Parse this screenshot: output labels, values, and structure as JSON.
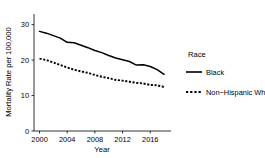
{
  "chart_data": {
    "type": "line",
    "title": "",
    "xlabel": "Year",
    "ylabel": "Mortality Rate per 100,000",
    "xlim": [
      1999.2,
      2019.0
    ],
    "ylim": [
      0,
      33
    ],
    "grid": false,
    "legend_position": "right",
    "legend_title": "Race",
    "xticks": [
      2000,
      2004,
      2008,
      2012,
      2016
    ],
    "xtick_labels": [
      "2000",
      "2004",
      "2008",
      "2012",
      "2016"
    ],
    "yticks": [
      0,
      10,
      20,
      30
    ],
    "ytick_labels": [
      "0",
      "10",
      "20",
      "30"
    ],
    "x": [
      2000,
      2001,
      2002,
      2003,
      2004,
      2005,
      2006,
      2007,
      2008,
      2009,
      2010,
      2011,
      2012,
      2013,
      2014,
      2015,
      2016,
      2017,
      2018
    ],
    "series": [
      {
        "name": "Black",
        "style": "solid",
        "color": "#000000",
        "values": [
          28.1,
          27.6,
          26.9,
          26.2,
          25.0,
          24.9,
          24.2,
          23.5,
          22.7,
          22.1,
          21.3,
          20.6,
          20.1,
          19.6,
          18.6,
          18.7,
          18.2,
          17.3,
          16.0
        ]
      },
      {
        "name": "Non−Hispanic White",
        "style": "dashed",
        "color": "#000000",
        "values": [
          20.4,
          20.0,
          19.3,
          18.6,
          17.9,
          17.3,
          16.8,
          16.4,
          15.8,
          15.3,
          14.9,
          14.4,
          14.2,
          13.9,
          13.6,
          13.4,
          13.0,
          12.9,
          12.4
        ]
      }
    ]
  },
  "legend": {
    "title": "Race",
    "entries": [
      {
        "label": "Black",
        "style": "solid"
      },
      {
        "label": "Non−Hispanic White",
        "style": "dashed"
      }
    ]
  },
  "axes": {
    "x_title": "Year",
    "y_title": "Mortality Rate per 100,000"
  }
}
